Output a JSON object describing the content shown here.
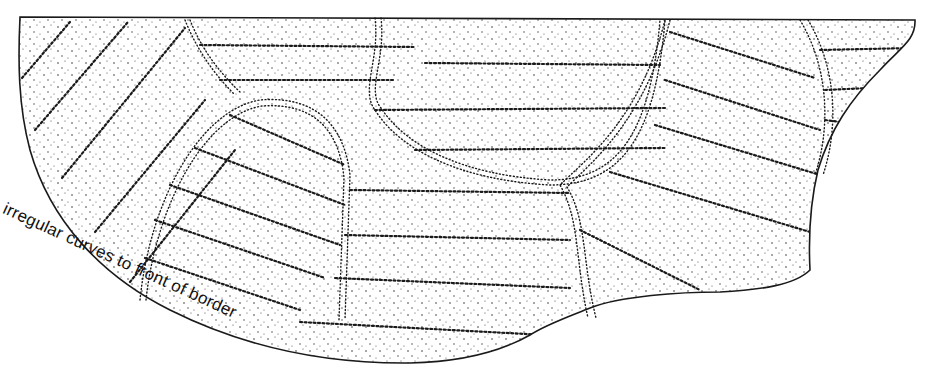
{
  "figure": {
    "type": "stippled line illustration",
    "annotation": {
      "text": "irregular curves to front of border"
    },
    "colors": {
      "ink": "#1a1a1a",
      "background": "#ffffff"
    }
  }
}
